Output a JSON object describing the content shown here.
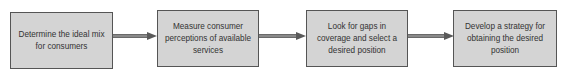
{
  "diagram": {
    "type": "process-flow",
    "direction": "left-to-right",
    "colors": {
      "box_fill": "#d4d4d4",
      "box_border": "#555555",
      "arrow": "#6a6a6a",
      "text": "#333333"
    },
    "steps": [
      {
        "label": "Determine the ideal mix for consumers"
      },
      {
        "label": "Measure consumer perceptions of available services"
      },
      {
        "label": "Look for gaps in coverage and select a desired position"
      },
      {
        "label": "Develop a strategy for obtaining the desired position"
      }
    ],
    "connectors": [
      {
        "from": 0,
        "to": 1,
        "style": "double-line-arrow"
      },
      {
        "from": 1,
        "to": 2,
        "style": "double-line-arrow"
      },
      {
        "from": 2,
        "to": 3,
        "style": "double-line-arrow"
      }
    ]
  }
}
